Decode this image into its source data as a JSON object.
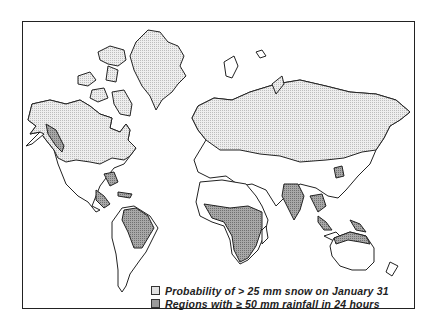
{
  "map": {
    "title": "",
    "projection": "world",
    "colors": {
      "land": "#ffffff",
      "snow": "#e2e2e2",
      "rain": "#9a9a9a",
      "outline": "#222222"
    }
  },
  "legend": {
    "items": [
      {
        "key": "snow",
        "label": "Probability of > 25 mm snow on January 31"
      },
      {
        "key": "rain",
        "label": "Regions with ≥ 50 mm rainfall in  24 hours"
      }
    ]
  }
}
